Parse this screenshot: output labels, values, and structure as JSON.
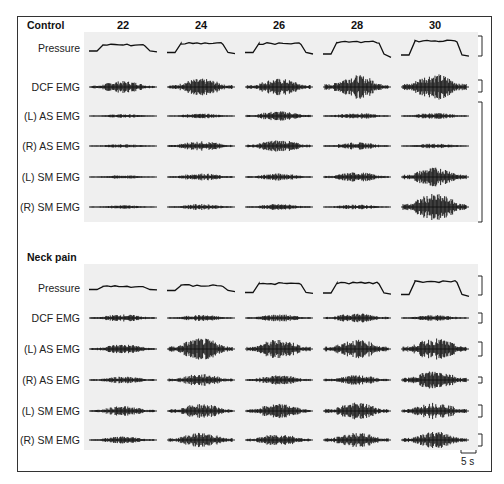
{
  "figure": {
    "columns": [
      "22",
      "24",
      "26",
      "28",
      "30"
    ],
    "column_x": [
      123,
      201,
      279,
      357,
      435
    ],
    "trace_halfwidth": 34,
    "colors": {
      "trace": "#111111",
      "panel": "#efefef",
      "frame": "#333333",
      "text": "#222222"
    },
    "scale_bar": {
      "label": "5 s",
      "x1": 461,
      "x2": 476,
      "y": 453
    }
  },
  "groups": [
    {
      "title": "Control",
      "title_y": 25,
      "panel": {
        "x": 84,
        "y": 32,
        "w": 394,
        "h": 190
      },
      "rows": [
        {
          "label": "Pressure",
          "y": 48,
          "type": "pressure",
          "amps": [
            6,
            9,
            9,
            12,
            14
          ],
          "drops": [
            3,
            4,
            5,
            11,
            4
          ]
        },
        {
          "label": "DCF EMG",
          "y": 87,
          "type": "emg",
          "amps": [
            5,
            7,
            7,
            10,
            11
          ]
        },
        {
          "label": "(L) AS EMG",
          "y": 116,
          "type": "emg",
          "amps": [
            1.5,
            2,
            4,
            2.5,
            2.5
          ]
        },
        {
          "label": "(R) AS EMG",
          "y": 146,
          "type": "emg",
          "amps": [
            1.5,
            4,
            5,
            3,
            2
          ]
        },
        {
          "label": "(L) SM EMG",
          "y": 177,
          "type": "emg",
          "amps": [
            1.5,
            3,
            3,
            4,
            8
          ]
        },
        {
          "label": "(R) SM EMG",
          "y": 207,
          "type": "emg",
          "amps": [
            1.5,
            2.5,
            2.5,
            2,
            11
          ]
        }
      ],
      "calibration_brackets": [
        {
          "y1": 36,
          "y2": 56
        },
        {
          "y1": 80,
          "y2": 92
        },
        {
          "y1": 102,
          "y2": 222
        }
      ]
    },
    {
      "title": "Neck pain",
      "title_y": 257,
      "panel": {
        "x": 84,
        "y": 264,
        "w": 394,
        "h": 186
      },
      "rows": [
        {
          "label": "Pressure",
          "y": 288,
          "type": "pressure",
          "amps": [
            3,
            5,
            9,
            10,
            13
          ],
          "drops": [
            1,
            4,
            3,
            4,
            6
          ]
        },
        {
          "label": "DCF EMG",
          "y": 318,
          "type": "emg",
          "amps": [
            3,
            2.5,
            3,
            4,
            2.5
          ]
        },
        {
          "label": "(L) AS EMG",
          "y": 349,
          "type": "emg",
          "amps": [
            4,
            9,
            8,
            8,
            9
          ]
        },
        {
          "label": "(R) AS EMG",
          "y": 380,
          "type": "emg",
          "amps": [
            3,
            5,
            4,
            4,
            8
          ]
        },
        {
          "label": "(L) SM EMG",
          "y": 411,
          "type": "emg",
          "amps": [
            4,
            6,
            6,
            7,
            7
          ]
        },
        {
          "label": "(R) SM EMG",
          "y": 440,
          "type": "emg",
          "amps": [
            3,
            6,
            5,
            6,
            7
          ]
        }
      ],
      "calibration_brackets": [
        {
          "y1": 276,
          "y2": 295
        },
        {
          "y1": 313,
          "y2": 323
        },
        {
          "y1": 342,
          "y2": 356
        },
        {
          "y1": 377,
          "y2": 383
        },
        {
          "y1": 405,
          "y2": 417
        },
        {
          "y1": 434,
          "y2": 446
        }
      ]
    }
  ]
}
